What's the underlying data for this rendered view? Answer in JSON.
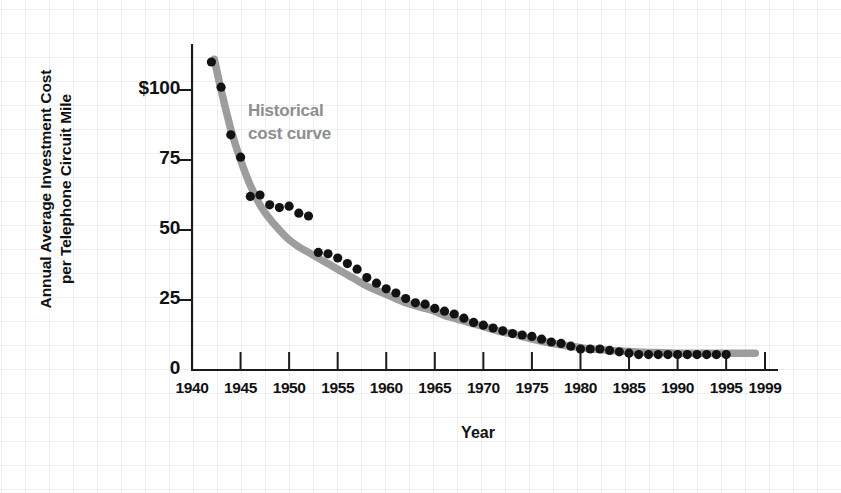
{
  "chart_data": {
    "type": "scatter",
    "title": "",
    "xlabel": "Year",
    "ylabel": "Annual Average Investment Cost per Telephone Circuit Mile",
    "ylabel_line1": "Annual Average Investment Cost",
    "ylabel_line2": "per Telephone Circuit Mile",
    "xlim": [
      1940,
      1999
    ],
    "ylim": [
      0,
      115
    ],
    "xticks": [
      1940,
      1945,
      1950,
      1955,
      1960,
      1965,
      1970,
      1975,
      1980,
      1985,
      1990,
      1995,
      1999
    ],
    "xticklabels": [
      "1940",
      "1945",
      "1950",
      "1955",
      "1960",
      "1965",
      "1970",
      "1975",
      "1980",
      "1985",
      "1990",
      "1995",
      "1999"
    ],
    "yticks": [
      0,
      25,
      50,
      75,
      100
    ],
    "yticklabels": [
      "0",
      "25",
      "50",
      "75",
      "$100"
    ],
    "grid": true,
    "legend": "none",
    "annotations": [
      {
        "text_line1": "Historical",
        "text_line2": "cost curve",
        "text": "Historical cost curve",
        "color": "#8e8e8e",
        "x": 1949,
        "y": 92
      }
    ],
    "series": [
      {
        "name": "Annual average investment cost per telephone circuit mile",
        "marker": "filled-circle",
        "color": "#121212",
        "x": [
          1942,
          1943,
          1944,
          1945,
          1946,
          1947,
          1948,
          1949,
          1950,
          1951,
          1952,
          1953,
          1954,
          1955,
          1956,
          1957,
          1958,
          1959,
          1960,
          1961,
          1962,
          1963,
          1964,
          1965,
          1966,
          1967,
          1968,
          1969,
          1970,
          1971,
          1972,
          1973,
          1974,
          1975,
          1976,
          1977,
          1978,
          1979,
          1980,
          1981,
          1982,
          1983,
          1984,
          1985,
          1986,
          1987,
          1988,
          1989,
          1990,
          1991,
          1992,
          1993,
          1994,
          1995
        ],
        "values": [
          110,
          101,
          84,
          76,
          62,
          62.5,
          59,
          58,
          58.5,
          56,
          55,
          42,
          41.5,
          40,
          38,
          36,
          33,
          31,
          29,
          27.5,
          25.5,
          24,
          23.5,
          22,
          21,
          20,
          18.5,
          17,
          16,
          15,
          14,
          13,
          12.5,
          12,
          11,
          10,
          9.5,
          8.5,
          7.5,
          7.5,
          7.5,
          7,
          6.5,
          6,
          5.5,
          5.5,
          5.5,
          5.5,
          5.5,
          5.5,
          5.5,
          5.5,
          5.5,
          5.5
        ]
      },
      {
        "name": "Historical cost curve (fitted)",
        "type": "line",
        "color": "#9d9d9d",
        "x": [
          1942.3,
          1943,
          1944,
          1945,
          1946,
          1947,
          1948,
          1949,
          1950,
          1951,
          1952,
          1953,
          1954,
          1955,
          1956,
          1957,
          1958,
          1959,
          1960,
          1961,
          1962,
          1963,
          1964,
          1965,
          1966,
          1967,
          1968,
          1969,
          1970,
          1971,
          1972,
          1973,
          1974,
          1975,
          1976,
          1977,
          1978,
          1979,
          1980,
          1981,
          1982,
          1983,
          1984,
          1985,
          1986,
          1987,
          1988,
          1989,
          1990,
          1991,
          1992,
          1993,
          1994,
          1995,
          1996,
          1997,
          1998
        ],
        "values": [
          111,
          100,
          86,
          75,
          66,
          59,
          54,
          50,
          46.5,
          44,
          42,
          40,
          38,
          36,
          34,
          32,
          30,
          28.5,
          27,
          25.5,
          24,
          23,
          22,
          21,
          19.5,
          18.5,
          17.5,
          16.5,
          15.5,
          14.5,
          13.5,
          13,
          12,
          11,
          10.3,
          9.6,
          9,
          8.4,
          8,
          7.6,
          7.3,
          7,
          6.8,
          6.6,
          6.4,
          6.3,
          6.2,
          6.1,
          6,
          6,
          6,
          6,
          6,
          6,
          6,
          6,
          6
        ]
      }
    ]
  },
  "axis_title_x": "Year",
  "colors": {
    "axis": "#1b1b1b",
    "dots": "#121212",
    "curve": "#9d9d9d",
    "annotation": "#8e8e8e",
    "grid": "#c7ced6",
    "background": "#ffffff"
  }
}
